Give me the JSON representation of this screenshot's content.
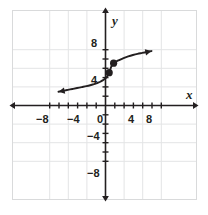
{
  "figure": {
    "kind": "coordinate-plane-graph",
    "width": 208,
    "height": 215,
    "background": "#ffffff",
    "frame": {
      "x": 12,
      "y": 10,
      "width": 184,
      "height": 189,
      "color": "#d9dadb"
    },
    "grid": {
      "color": "#e3e4e5",
      "step_units": 4,
      "visible": true
    },
    "axis_color": "#231f20",
    "curve_color": "#231f20",
    "point_color": "#231f20"
  },
  "axes": {
    "x_name": "x",
    "y_name": "y",
    "x_name_pos": {
      "x": 186,
      "y": 88
    },
    "y_name_pos": {
      "x": 112,
      "y": 14
    },
    "origin_px": {
      "x": 105,
      "y": 105
    },
    "px_per_unit": 4.65,
    "x_range": [
      -10.0,
      10.0
    ],
    "y_range": [
      -10.0,
      10.0
    ],
    "tick_step_units": 2,
    "grid_step_units": 4,
    "tick_len_px": 3
  },
  "labels": {
    "x_ticks": [
      {
        "text": "−8",
        "value": -8,
        "x": 36,
        "y": 114
      },
      {
        "text": "−4",
        "value": -4,
        "x": 67,
        "y": 114
      },
      {
        "text": "0",
        "value": 0,
        "x": 97,
        "y": 114
      },
      {
        "text": "4",
        "value": 4,
        "x": 128,
        "y": 114
      },
      {
        "text": "8",
        "value": 8,
        "x": 146,
        "y": 114
      }
    ],
    "y_ticks": [
      {
        "text": "8",
        "value": 8,
        "x": 91,
        "y": 38
      },
      {
        "text": "4",
        "value": 4,
        "x": 91,
        "y": 75
      },
      {
        "text": "−4",
        "value": -4,
        "x": 87,
        "y": 131
      },
      {
        "text": "−8",
        "value": -8,
        "x": 87,
        "y": 168
      }
    ]
  },
  "chart_data": {
    "type": "line",
    "title": "",
    "xlabel": "x",
    "ylabel": "y",
    "xlim": [
      -10,
      10
    ],
    "ylim": [
      -10,
      10
    ],
    "grid": true,
    "legend": "none",
    "series": [
      {
        "name": "curve",
        "x": [
          -10.0,
          -9.0,
          -8.0,
          -7.0,
          -6.0,
          -5.0,
          -4.0,
          -3.0,
          -2.5,
          -2.0,
          -1.5,
          -1.0,
          -0.5,
          0.0,
          0.25,
          0.5,
          0.75,
          0.9,
          1.0,
          1.1,
          1.25,
          1.5,
          1.75,
          2.0,
          2.5,
          3.0,
          4.0,
          5.0,
          6.0,
          7.0,
          8.0,
          9.0,
          10.0
        ],
        "y": [
          2.85,
          3.05,
          3.25,
          3.45,
          3.65,
          3.85,
          4.05,
          4.3,
          4.45,
          4.6,
          4.8,
          5.0,
          5.3,
          5.65,
          5.9,
          6.2,
          6.65,
          6.95,
          7.1,
          7.5,
          8.0,
          8.55,
          8.85,
          9.05,
          9.4,
          9.65,
          10.1,
          10.45,
          10.75,
          11.0,
          11.2,
          11.4,
          11.6
        ]
      }
    ],
    "marked_points": [
      {
        "label": "point-1",
        "x": 0.9,
        "y": 6.95
      },
      {
        "label": "point-2",
        "x": 1.85,
        "y": 9.0
      }
    ]
  }
}
